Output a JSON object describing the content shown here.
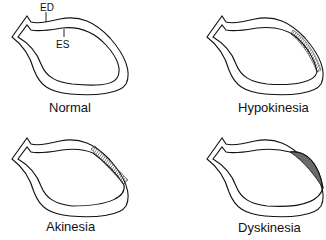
{
  "diagram": {
    "annotations": {
      "ed": "ED",
      "es": "ES"
    },
    "panels": [
      {
        "id": "normal",
        "label": "Normal",
        "abnormal_segment": "none"
      },
      {
        "id": "hypokinesia",
        "label": "Hypokinesia",
        "abnormal_segment": "reduced inward motion of anterolateral/apical wall (thin hatched band)"
      },
      {
        "id": "akinesia",
        "label": "Akinesia",
        "abnormal_segment": "no motion of anterior wall segment (hatched band, ED and ES contours coincide)"
      },
      {
        "id": "dyskinesia",
        "label": "Dyskinesia",
        "abnormal_segment": "paradoxical outward bulge of apical segment at ES (hatched crescent)"
      }
    ],
    "colors": {
      "line": "#111111",
      "hatch": "#555555",
      "background": "#ffffff"
    }
  }
}
